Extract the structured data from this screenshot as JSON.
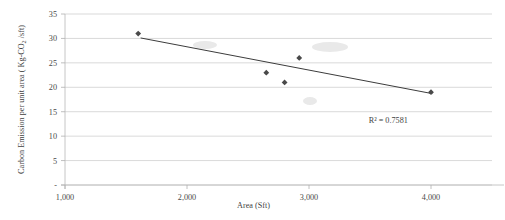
{
  "chart_data": {
    "type": "scatter",
    "title": "",
    "xlabel": "Area (Sft)",
    "ylabel": "Carbon Emission per unit area ( Kg-CO2 /sft)",
    "ylabel_parts": {
      "before": "Carbon Emission per unit area ( Kg-CO",
      "subscript": "2",
      "after": " /sft)"
    },
    "xlim": [
      1000,
      4500
    ],
    "ylim": [
      0,
      35
    ],
    "grid": true,
    "grid_axis": "y",
    "legend": "none",
    "x": [
      1600,
      2650,
      2800,
      2920,
      4000
    ],
    "y": [
      31,
      23,
      21,
      26,
      19
    ],
    "points": [
      {
        "x": 1600,
        "y": 31
      },
      {
        "x": 2650,
        "y": 23
      },
      {
        "x": 2800,
        "y": 21
      },
      {
        "x": 2920,
        "y": 26
      },
      {
        "x": 4000,
        "y": 19
      }
    ],
    "series": [
      {
        "name": "Carbon Emission per unit area",
        "marker": "diamond",
        "color": "#4a4a4a",
        "values": [
          31,
          23,
          21,
          26,
          19
        ]
      }
    ],
    "trendline": {
      "type": "linear",
      "color": "#3c3c3c",
      "x_start": 1620,
      "y_start": 30.1,
      "x_end": 4010,
      "y_end": 18.7
    },
    "annotations": [
      {
        "name": "r-squared",
        "text": "R² = 0.7581",
        "x": 3650,
        "y": 12.6
      }
    ],
    "xticks": [
      1000,
      2000,
      3000,
      4000
    ],
    "xtick_labels": [
      "1,000",
      "2,000",
      "3,000",
      "4,000"
    ],
    "yticks": [
      0,
      5,
      10,
      15,
      20,
      25,
      30,
      35
    ],
    "ytick_labels": [
      "-",
      "5",
      "10",
      "15",
      "20",
      "25",
      "30",
      "35"
    ]
  },
  "colors": {
    "marker": "#4a4a4a",
    "trendline": "#3c3c3c",
    "gridline": "#c9c9c9",
    "axis": "#b8b8b8",
    "text": "#3f3f3f",
    "background": "#ffffff"
  }
}
